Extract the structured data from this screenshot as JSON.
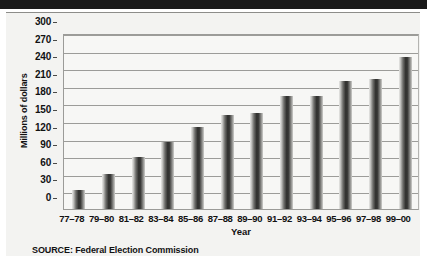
{
  "chart_data": {
    "type": "bar",
    "title": "",
    "subtitle": "",
    "xlabel": "Year",
    "ylabel": "Millions of dollars",
    "ylim": [
      0,
      300
    ],
    "yticks": [
      0,
      30,
      60,
      90,
      120,
      150,
      180,
      210,
      240,
      270,
      300
    ],
    "grid": true,
    "legend": null,
    "categories": [
      "77–78",
      "79–80",
      "81–82",
      "83–84",
      "85–86",
      "87–88",
      "89–90",
      "91–92",
      "93–94",
      "95–96",
      "97–98",
      "99–00"
    ],
    "values": [
      33,
      60,
      89,
      114,
      140,
      161,
      163,
      192,
      192,
      219,
      221,
      259
    ],
    "source": "SOURCE: Federal Election Commission",
    "bar_color": "#2e2e2c"
  },
  "axes": {
    "y_title": "Millions of dollars",
    "x_title": "Year",
    "y_tick_labels": [
      "300",
      "270",
      "240",
      "210",
      "180",
      "150",
      "120",
      "90",
      "60",
      "30",
      "0"
    ],
    "x_tick_labels": [
      "77–78",
      "79–80",
      "81–82",
      "83–84",
      "85–86",
      "87–88",
      "89–90",
      "91–92",
      "93–94",
      "95–96",
      "97–98",
      "99–00"
    ]
  },
  "notes": {
    "source": "SOURCE: Federal Election Commission"
  },
  "colors": {
    "masthead": "#1a1a1a",
    "panel_background": "#f3f3f1",
    "plot_background": "#f7f7f5",
    "gridline": "#9c9c99",
    "bar_dark": "#2e2e2c",
    "text": "#111111"
  }
}
